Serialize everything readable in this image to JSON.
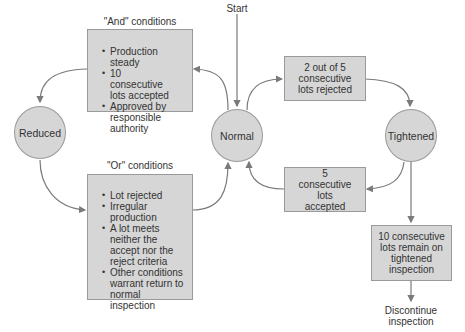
{
  "diagram": {
    "type": "state-transition",
    "start_label": "Start",
    "states": {
      "reduced": "Reduced",
      "normal": "Normal",
      "tightened": "Tightened"
    },
    "and_conditions": {
      "title": "\"And\" conditions",
      "items": [
        "Production steady",
        "10 consecutive lots accepted",
        "Approved by responsible authority"
      ]
    },
    "or_conditions": {
      "title": "\"Or\" conditions",
      "items": [
        "Lot rejected",
        "Irregular production",
        "A lot meets neither the accept nor the reject criteria",
        "Other conditions warrant return to normal inspection"
      ]
    },
    "transitions": {
      "normal_to_tightened": "2 out of 5 consecutive lots rejected",
      "tightened_to_normal": "5 consecutive lots accepted",
      "tightened_to_discontinue": "10 consecutive lots remain on tightened inspection"
    },
    "end_label": "Discontinue inspection",
    "colors": {
      "fill": "#d6d6d6",
      "stroke": "#9a9a9a",
      "arrow": "#7a7a7a",
      "text": "#333333"
    }
  }
}
